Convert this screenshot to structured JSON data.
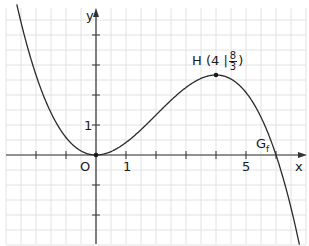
{
  "chart_data": {
    "type": "line",
    "title": "",
    "xlabel": "x",
    "ylabel": "y",
    "function": "f(x) = -x^3/12 + x^2/2",
    "xlim": [
      -3.0,
      7.0
    ],
    "ylim": [
      -3.0,
      4.8
    ],
    "grid": true,
    "grid_step": 0.5,
    "x_tick_labels": [
      {
        "x": 1,
        "label": "1"
      },
      {
        "x": 5,
        "label": "5"
      }
    ],
    "y_tick_labels": [
      {
        "y": 1,
        "label": "1"
      }
    ],
    "origin_label": "O",
    "curve_label": "Gf",
    "series": [
      {
        "name": "Gf",
        "x": [
          -2.4,
          -2,
          -1.5,
          -1,
          -0.5,
          0,
          0.5,
          1,
          1.5,
          2,
          2.5,
          3,
          3.5,
          4,
          4.5,
          5,
          5.5,
          6,
          6.5,
          7
        ],
        "y": [
          4.03,
          2.67,
          1.41,
          0.58,
          0.14,
          0,
          0.11,
          0.42,
          0.84,
          1.33,
          1.82,
          2.25,
          2.55,
          2.67,
          2.53,
          2.08,
          1.26,
          0,
          -1.76,
          -4.08
        ]
      }
    ],
    "annotations": [
      {
        "type": "point",
        "x": 4,
        "y": 2.667,
        "label": "H (4 | 8/3)"
      },
      {
        "type": "point",
        "x": 0,
        "y": 0,
        "label": "O"
      }
    ]
  },
  "labels": {
    "y_axis": "y",
    "x_axis": "x",
    "origin": "O",
    "tick_x1": "1",
    "tick_x5": "5",
    "tick_y1": "1",
    "curve": "G",
    "curve_sub": "f",
    "point_h_prefix": "H (4 |",
    "point_h_num": "8",
    "point_h_den": "3",
    "point_h_suffix": ")"
  }
}
